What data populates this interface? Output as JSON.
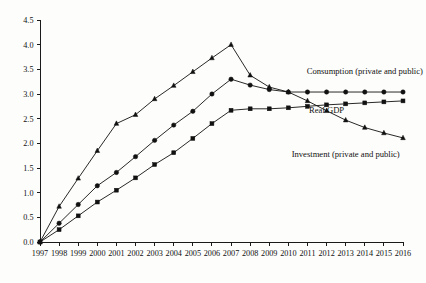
{
  "chart_data": {
    "type": "line",
    "title": "",
    "subtitle": "",
    "xlabel": "",
    "ylabel": "",
    "grid": false,
    "legend_position": "inline-annotations",
    "x": [
      1997,
      1998,
      1999,
      2000,
      2001,
      2002,
      2003,
      2004,
      2005,
      2006,
      2007,
      2008,
      2009,
      2010,
      2011,
      2012,
      2013,
      2014,
      2015,
      2016
    ],
    "xtick_labels": [
      "1997",
      "1998",
      "1999",
      "2000",
      "2001",
      "2002",
      "2003",
      "2004",
      "2005",
      "2006",
      "2007",
      "2008",
      "2009",
      "2010",
      "2011",
      "2012",
      "2013",
      "2014",
      "2015",
      "2016"
    ],
    "ytick_labels": [
      "0.0",
      "0.5",
      "1.0",
      "1.5",
      "2.0",
      "2.5",
      "3.0",
      "3.5",
      "4.0",
      "4.5"
    ],
    "ytick_values": [
      0.0,
      0.5,
      1.0,
      1.5,
      2.0,
      2.5,
      3.0,
      3.5,
      4.0,
      4.5
    ],
    "ylim": [
      0.0,
      4.5
    ],
    "xlim": [
      1997,
      2016
    ],
    "series": [
      {
        "name": "Investment (private and public)",
        "marker": "triangle",
        "annotation": "Investment (private and public)",
        "annotation_x": 2013,
        "annotation_y": 1.72,
        "values": [
          0.0,
          0.72,
          1.29,
          1.85,
          2.4,
          2.58,
          2.9,
          3.17,
          3.45,
          3.73,
          4.0,
          3.38,
          3.14,
          3.04,
          2.86,
          2.66,
          2.47,
          2.32,
          2.21,
          2.11
        ]
      },
      {
        "name": "Consumption (private and public)",
        "marker": "circle",
        "annotation": "Consumption (private and public)",
        "annotation_x": 2014,
        "annotation_y": 3.4,
        "values": [
          0.0,
          0.38,
          0.76,
          1.14,
          1.41,
          1.73,
          2.06,
          2.37,
          2.65,
          3.0,
          3.3,
          3.18,
          3.09,
          3.04,
          3.04,
          3.04,
          3.04,
          3.04,
          3.04,
          3.04
        ]
      },
      {
        "name": "Real GDP",
        "marker": "square",
        "annotation": "Real GDP",
        "annotation_x": 2012,
        "annotation_y": 2.62,
        "values": [
          0.0,
          0.25,
          0.53,
          0.81,
          1.05,
          1.3,
          1.57,
          1.81,
          2.1,
          2.4,
          2.67,
          2.7,
          2.7,
          2.72,
          2.75,
          2.78,
          2.8,
          2.82,
          2.84,
          2.86
        ]
      }
    ]
  }
}
